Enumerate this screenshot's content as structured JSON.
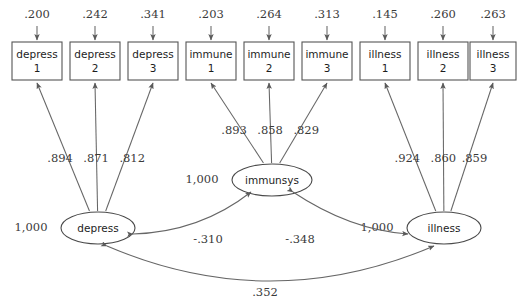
{
  "diagram": {
    "type": "structural-equation-model",
    "latent_variables": [
      {
        "id": "depress",
        "label": "depress",
        "variance": "1,000",
        "cx": 98,
        "cy": 228
      },
      {
        "id": "immunsys",
        "label": "immunsys",
        "variance": "1,000",
        "cx": 272,
        "cy": 180
      },
      {
        "id": "illness",
        "label": "illness",
        "variance": "1,000",
        "cx": 444,
        "cy": 228
      }
    ],
    "indicators": [
      {
        "id": "depress1",
        "name": "depress",
        "index": "1",
        "error": ".200",
        "loading": ".894",
        "x": 12,
        "factor": "depress"
      },
      {
        "id": "depress2",
        "name": "depress",
        "index": "2",
        "error": ".242",
        "loading": ".871",
        "x": 70,
        "factor": "depress"
      },
      {
        "id": "depress3",
        "name": "depress",
        "index": "3",
        "error": ".341",
        "loading": ".812",
        "x": 128,
        "factor": "depress"
      },
      {
        "id": "immune1",
        "name": "immune",
        "index": "1",
        "error": ".203",
        "loading": ".893",
        "x": 186,
        "factor": "immunsys"
      },
      {
        "id": "immune2",
        "name": "immune",
        "index": "2",
        "error": ".264",
        "loading": ".858",
        "x": 244,
        "factor": "immunsys"
      },
      {
        "id": "immune3",
        "name": "immune",
        "index": "3",
        "error": ".313",
        "loading": ".829",
        "x": 302,
        "factor": "immunsys"
      },
      {
        "id": "illness1",
        "name": "illness",
        "index": "1",
        "error": ".145",
        "loading": ".924",
        "x": 360,
        "factor": "illness"
      },
      {
        "id": "illness2",
        "name": "illness",
        "index": "2",
        "error": ".260",
        "loading": ".860",
        "x": 418,
        "factor": "illness"
      },
      {
        "id": "illness3",
        "name": "illness",
        "index": "3",
        "error": ".263",
        "loading": ".859",
        "x": 470,
        "factor": "illness"
      }
    ],
    "covariances": [
      {
        "id": "depress-immunsys",
        "label": "-.310",
        "from": "depress",
        "to": "immunsys"
      },
      {
        "id": "immunsys-illness",
        "label": "-.348",
        "from": "immunsys",
        "to": "illness"
      },
      {
        "id": "depress-illness",
        "label": ".352",
        "from": "depress",
        "to": "illness"
      }
    ],
    "colors": {
      "stroke": "#666666",
      "box_stroke": "#555555",
      "text": "#1d1d1d",
      "number_text": "#3a3a3a",
      "background": "#ffffff"
    }
  }
}
